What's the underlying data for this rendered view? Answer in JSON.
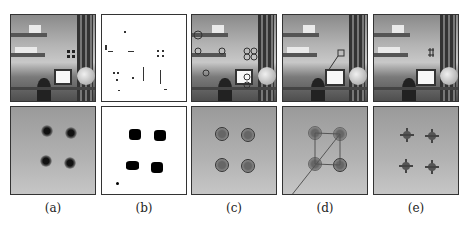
{
  "figure": {
    "panels": [
      {
        "label": "(a)",
        "top": "original office scene",
        "bottom": "close-up of four dark markers"
      },
      {
        "label": "(b)",
        "top": "binarized scene (sparse dark points)",
        "bottom": "binarized markers"
      },
      {
        "label": "(c)",
        "top": "scene with detected circles",
        "bottom": "markers with circle detections"
      },
      {
        "label": "(d)",
        "top": "scene with connected marker quadrilateral",
        "bottom": "markers connected by lines"
      },
      {
        "label": "(e)",
        "top": "scene with cross markers",
        "bottom": "markers with cross-shaped estimates"
      }
    ]
  }
}
